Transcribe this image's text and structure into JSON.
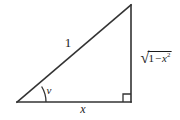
{
  "figure": {
    "type": "right-triangle-diagram",
    "stroke_color": "#333333",
    "background_color": "#ffffff",
    "vertices": {
      "left": [
        17,
        102
      ],
      "bottom_right": [
        131,
        102
      ],
      "apex": [
        131,
        5
      ]
    },
    "labels": {
      "hypotenuse": "1",
      "angle": "v",
      "base": "x",
      "vertical_sign": "√",
      "vertical_radicand_first": "1",
      "vertical_radicand_operator": "−",
      "vertical_radicand_var": "x",
      "vertical_radicand_exponent": "2"
    },
    "markers": {
      "right_angle": "right-angle-square",
      "angle_arc": "angle-arc"
    }
  }
}
